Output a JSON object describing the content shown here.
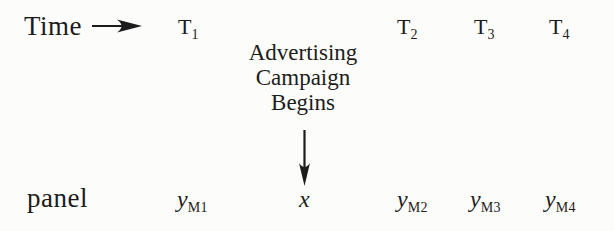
{
  "colors": {
    "ink": "#1c1c1c",
    "background": "#fcfcfa"
  },
  "icons": {
    "time_arrow": "right-arrow",
    "campaign_arrow": "down-arrow"
  },
  "header": {
    "time_label": "Time"
  },
  "timeline": {
    "t_labels": [
      {
        "base": "T",
        "sub": "1"
      },
      {
        "base": "T",
        "sub": "2"
      },
      {
        "base": "T",
        "sub": "3"
      },
      {
        "base": "T",
        "sub": "4"
      }
    ]
  },
  "annotation": {
    "lines": [
      "Advertising",
      "Campaign",
      "Begins"
    ],
    "target_label": "x"
  },
  "panel_row": {
    "row_label": "panel",
    "y_labels": [
      {
        "base": "y",
        "sub": "M1"
      },
      {
        "base": "y",
        "sub": "M2"
      },
      {
        "base": "y",
        "sub": "M3"
      },
      {
        "base": "y",
        "sub": "M4"
      }
    ]
  }
}
